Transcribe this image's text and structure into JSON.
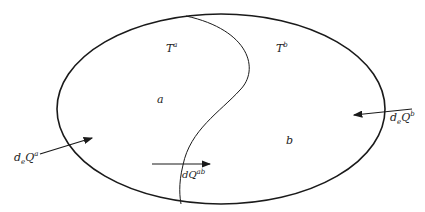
{
  "diagram": {
    "type": "two-subsystem heat exchange",
    "regions": [
      {
        "id": "a",
        "label": "a",
        "temperature_label": "T",
        "temperature_sup": "a"
      },
      {
        "id": "b",
        "label": "b",
        "temperature_label": "T",
        "temperature_sup": "b"
      }
    ],
    "arrows": [
      {
        "id": "deQa",
        "base": "d",
        "sub": "e",
        "main": "Q",
        "sup": "a",
        "direction": "into region a from outside"
      },
      {
        "id": "dQab",
        "base": "dQ",
        "sup": "ab",
        "direction": "from a to b across boundary"
      },
      {
        "id": "deQb",
        "base": "d",
        "sub": "e",
        "main": "Q",
        "sup": "b",
        "direction": "into region b from outside"
      }
    ],
    "colors": {
      "stroke": "#1a1a1a",
      "background": "#ffffff"
    }
  }
}
